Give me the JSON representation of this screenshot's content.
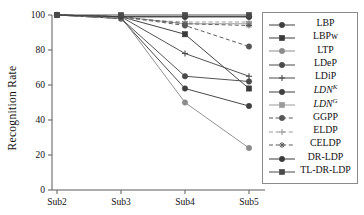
{
  "chart_data": {
    "type": "line",
    "title": "",
    "xlabel": "",
    "ylabel": "Recognition Rate",
    "categories": [
      "Sub2",
      "Sub3",
      "Sub4",
      "Sub5"
    ],
    "ylim": [
      0,
      100
    ],
    "yticks": [
      0,
      20,
      40,
      60,
      80,
      100
    ],
    "xticks": [
      "Sub2",
      "Sub3",
      "Sub4",
      "Sub5"
    ],
    "grid": false,
    "legend_position": "right-outside",
    "series": [
      {
        "name": "LBP",
        "label": "LBP",
        "marker": "circle",
        "dash": "solid",
        "color": "#3f3f3f",
        "values": [
          100,
          98,
          58,
          48
        ]
      },
      {
        "name": "LBPw",
        "label": "LBPw",
        "marker": "square",
        "dash": "solid",
        "color": "#3a3a3a",
        "values": [
          100,
          99,
          89,
          58
        ]
      },
      {
        "name": "LTP",
        "label": "LTP",
        "marker": "circle",
        "dash": "solid",
        "color": "#8c8c8c",
        "values": [
          100,
          99,
          50,
          24
        ]
      },
      {
        "name": "LDeP",
        "label": "LDeP",
        "marker": "circle",
        "dash": "solid",
        "color": "#4a4a4a",
        "values": [
          100,
          98,
          65,
          62
        ]
      },
      {
        "name": "LDiP",
        "label": "LDiP",
        "marker": "plus",
        "dash": "solid",
        "color": "#4a4a4a",
        "values": [
          100,
          99,
          78,
          65
        ]
      },
      {
        "name": "LDN_K",
        "label": "LDN",
        "sup": "K",
        "italic": true,
        "marker": "circle",
        "dash": "solid",
        "color": "#3f3f3f",
        "values": [
          100,
          99,
          99,
          99
        ]
      },
      {
        "name": "LDN_G",
        "label": "LDN",
        "sup": "G",
        "italic": true,
        "marker": "square",
        "dash": "solid",
        "color": "#9a9a9a",
        "values": [
          100,
          99,
          95,
          95
        ]
      },
      {
        "name": "GGPP",
        "label": "GGPP",
        "marker": "circle",
        "dash": "dashed",
        "color": "#555555",
        "values": [
          100,
          99,
          94,
          82
        ]
      },
      {
        "name": "ELDP",
        "label": "ELDP",
        "marker": "plus",
        "dash": "dashed",
        "color": "#9a9a9a",
        "values": [
          100,
          98,
          96,
          96
        ]
      },
      {
        "name": "CELDP",
        "label": "CELDP",
        "marker": "star",
        "dash": "dashed",
        "color": "#5a5a5a",
        "values": [
          100,
          99,
          95,
          94
        ]
      },
      {
        "name": "DR-LDP",
        "label": "DR-LDP",
        "marker": "circle",
        "dash": "solid",
        "color": "#3a3a3a",
        "values": [
          100,
          99,
          99,
          99
        ]
      },
      {
        "name": "TL-DR-LDP",
        "label": "TL-DR-LDP",
        "marker": "square",
        "dash": "solid",
        "color": "#4a4a4a",
        "values": [
          100,
          100,
          100,
          100
        ]
      }
    ]
  },
  "legend": {
    "entries": [
      {
        "label": "LBP"
      },
      {
        "label": "LBPw"
      },
      {
        "label": "LTP"
      },
      {
        "label": "LDeP"
      },
      {
        "label": "LDiP"
      },
      {
        "label": "LDN",
        "sup": "K",
        "italic": true
      },
      {
        "label": "LDN",
        "sup": "G",
        "italic": true
      },
      {
        "label": "GGPP"
      },
      {
        "label": "ELDP"
      },
      {
        "label": "CELDP"
      },
      {
        "label": "DR-LDP"
      },
      {
        "label": "TL-DR-LDP"
      }
    ]
  },
  "axis": {
    "y_title": "Recognition Rate",
    "y_tick_labels": [
      "100",
      "80",
      "60",
      "40",
      "20",
      "0"
    ],
    "x_tick_labels": [
      "Sub2",
      "Sub3",
      "Sub4",
      "Sub5"
    ]
  },
  "colors": {
    "axis": "#5a5a5a",
    "text": "#111111",
    "legend_border": "#8a8a8a",
    "background": "#ffffff"
  }
}
